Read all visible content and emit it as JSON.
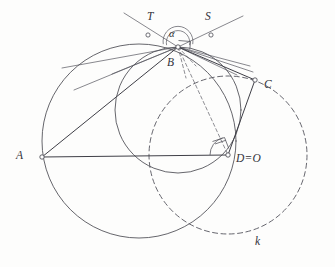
{
  "figure": {
    "background_color": "#fdfdfc",
    "ink_color": "#4a4a52",
    "labels": {
      "A": "A",
      "B": "B",
      "C": "C",
      "D_eq_O": "D=O",
      "T": "T",
      "S": "S",
      "alpha": "α",
      "k": "k"
    },
    "label_positions": {
      "A": {
        "x": 16,
        "y": 150
      },
      "B": {
        "x": 167,
        "y": 57
      },
      "C": {
        "x": 264,
        "y": 79
      },
      "D_eq_O": {
        "x": 236,
        "y": 153
      },
      "T": {
        "x": 147,
        "y": 11
      },
      "S": {
        "x": 205,
        "y": 11
      },
      "alpha": {
        "x": 169,
        "y": 29
      },
      "k": {
        "x": 255,
        "y": 236
      }
    },
    "points": {
      "A": {
        "x": 42,
        "y": 157
      },
      "B": {
        "x": 178,
        "y": 47
      },
      "C": {
        "x": 255,
        "y": 80
      },
      "D": {
        "x": 228,
        "y": 155
      },
      "tangent_marker_T": {
        "x": 148,
        "y": 35
      },
      "tangent_marker_S": {
        "x": 211,
        "y": 35
      }
    },
    "circles": [
      {
        "name": "large-solid-circle",
        "style": "solid",
        "cx": 139,
        "cy": 141,
        "r": 97,
        "note": "circumcircle through A and B"
      },
      {
        "name": "middle-solid-circle",
        "style": "solid",
        "cx": 178,
        "cy": 110,
        "r": 63,
        "note": "circle through B and D"
      },
      {
        "name": "small-solid-circle",
        "style": "solid",
        "cx": 176,
        "cy": 40,
        "r": 13,
        "note": "angle alpha arc circle at B"
      },
      {
        "name": "dashed-circle-k",
        "style": "dashed",
        "cx": 228,
        "cy": 155,
        "r": 79,
        "note": "circle k centred at D=O"
      }
    ],
    "segments": [
      {
        "name": "segment-AB",
        "from": "A",
        "to": "B",
        "style": "solid"
      },
      {
        "name": "segment-AD",
        "from": "A",
        "to": "D",
        "style": "solid"
      },
      {
        "name": "segment-BC",
        "from": "B",
        "to": "C",
        "style": "solid"
      },
      {
        "name": "segment-CD",
        "from": "C",
        "to": "D",
        "style": "solid"
      },
      {
        "name": "segment-BD",
        "from": "B",
        "to": "D",
        "style": "dashed"
      }
    ],
    "tangent_lines": [
      {
        "name": "tangent-line-T",
        "label": "T"
      },
      {
        "name": "tangent-line-S",
        "label": "S"
      }
    ],
    "angle_marks": [
      {
        "name": "angle-alpha-at-B",
        "label": "α",
        "vertex": "B"
      },
      {
        "name": "right-angle-mark-at-B",
        "vertex": "B"
      },
      {
        "name": "right-angle-mark-at-D",
        "vertex": "D"
      }
    ]
  }
}
